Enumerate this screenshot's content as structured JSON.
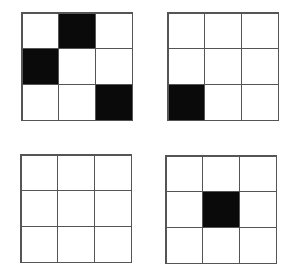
{
  "diagram": {
    "rows": 3,
    "cols": 3,
    "colors": {
      "filled": "#0a0a0a",
      "empty": "#ffffff",
      "border": "#555555"
    },
    "grids": [
      {
        "id": "top-left",
        "filled": [
          [
            0,
            1
          ],
          [
            1,
            0
          ],
          [
            2,
            2
          ]
        ]
      },
      {
        "id": "top-right",
        "filled": [
          [
            2,
            0
          ]
        ]
      },
      {
        "id": "bottom-left",
        "filled": []
      },
      {
        "id": "bottom-right",
        "filled": [
          [
            1,
            1
          ]
        ]
      }
    ]
  }
}
